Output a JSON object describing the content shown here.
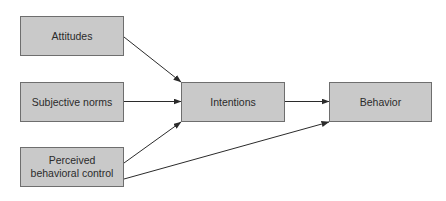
{
  "diagram": {
    "type": "flowchart",
    "title": "",
    "nodes": {
      "attitudes": {
        "label": "Attitudes",
        "x": 20,
        "y": 16,
        "w": 104,
        "h": 40
      },
      "subjective_norms": {
        "label": "Subjective norms",
        "x": 20,
        "y": 82,
        "w": 104,
        "h": 40
      },
      "perceived_behavioral_control": {
        "label_line1": "Perceived",
        "label_line2": "behavioral control",
        "x": 20,
        "y": 147,
        "w": 104,
        "h": 40
      },
      "intentions": {
        "label": "Intentions",
        "x": 181,
        "y": 82,
        "w": 104,
        "h": 40
      },
      "behavior": {
        "label": "Behavior",
        "x": 329,
        "y": 82,
        "w": 103,
        "h": 40
      }
    },
    "edges": [
      {
        "from": "attitudes",
        "to": "intentions"
      },
      {
        "from": "subjective_norms",
        "to": "intentions"
      },
      {
        "from": "perceived_behavioral_control",
        "to": "intentions"
      },
      {
        "from": "intentions",
        "to": "behavior"
      },
      {
        "from": "perceived_behavioral_control",
        "to": "behavior"
      }
    ],
    "colors": {
      "node_fill": "#c9c9c9",
      "node_border": "#6e6e6e",
      "text": "#2b2b2b",
      "arrow": "#2b2b2b"
    }
  }
}
